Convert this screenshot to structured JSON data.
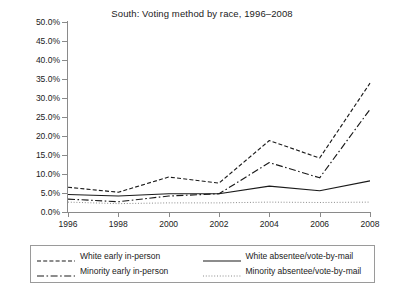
{
  "chart_data": {
    "type": "line",
    "title": "South: Voting method by race, 1996–2008",
    "xlabel": "",
    "ylabel": "",
    "x": [
      1996,
      1998,
      2000,
      2002,
      2004,
      2006,
      2008
    ],
    "categories": [
      "1996",
      "1998",
      "2000",
      "2002",
      "2004",
      "2006",
      "2008"
    ],
    "xlim": [
      1996,
      2008
    ],
    "ylim": [
      0,
      50
    ],
    "ytick_labels": [
      "0.0%",
      "5.0%",
      "10.0%",
      "15.0%",
      "20.0%",
      "25.0%",
      "30.0%",
      "35.0%",
      "40.0%",
      "45.0%",
      "50.0%"
    ],
    "ytick_values": [
      0,
      5,
      10,
      15,
      20,
      25,
      30,
      35,
      40,
      45,
      50
    ],
    "grid": false,
    "legend_position": "below-plot",
    "series": [
      {
        "name": "White early in-person",
        "style": "dashed",
        "color": "#1a1a1a",
        "values": [
          6.5,
          5.2,
          9.2,
          7.6,
          18.8,
          14.2,
          33.9
        ]
      },
      {
        "name": "White absentee/vote-by-mail",
        "style": "solid",
        "color": "#1a1a1a",
        "values": [
          4.6,
          4.2,
          4.8,
          4.8,
          6.8,
          5.6,
          8.2
        ]
      },
      {
        "name": "Minority early in-person",
        "style": "dash-dot",
        "color": "#1a1a1a",
        "values": [
          3.4,
          2.7,
          4.2,
          4.8,
          13.0,
          9.0,
          27.0
        ]
      },
      {
        "name": "Minority absentee/vote-by-mail",
        "style": "dotted",
        "color": "#8c8c8c",
        "values": [
          2.6,
          2.2,
          2.4,
          2.4,
          2.6,
          2.5,
          2.6
        ]
      }
    ]
  },
  "legend": {
    "items": [
      {
        "label": "White early in-person",
        "style": "dashed"
      },
      {
        "label": "White absentee/vote-by-mail",
        "style": "solid"
      },
      {
        "label": "Minority early in-person",
        "style": "dash-dot"
      },
      {
        "label": "Minority absentee/vote-by-mail",
        "style": "dotted"
      }
    ]
  }
}
